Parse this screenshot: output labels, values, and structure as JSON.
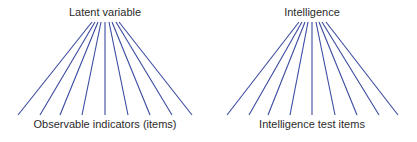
{
  "diagrams": [
    {
      "top_label": "Latent variable",
      "bottom_label": "Observable indicators (items)"
    },
    {
      "top_label": "Intelligence",
      "bottom_label": "Intelligence test items"
    }
  ],
  "colors": {
    "line": "#3a4aa0",
    "text": "#2b2b2b",
    "background": "#ffffff"
  }
}
